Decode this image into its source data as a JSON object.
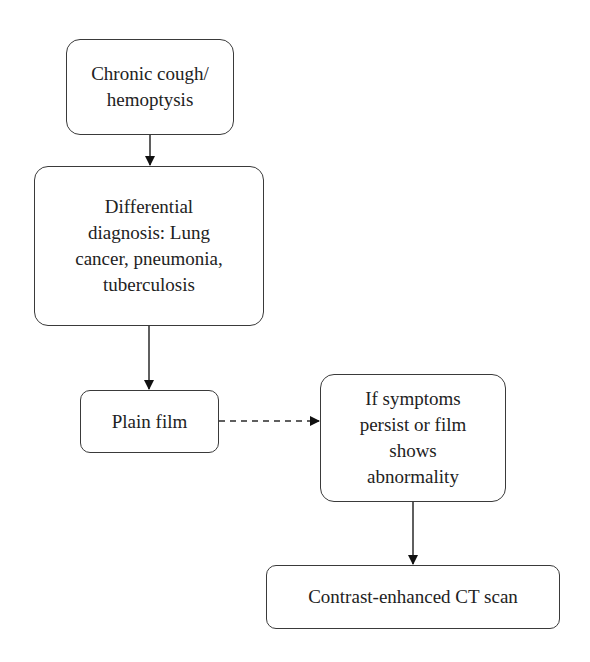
{
  "diagram": {
    "type": "flowchart",
    "colors": {
      "border": "#3a3a3a",
      "text": "#222222",
      "arrow": "#111111",
      "background": "#ffffff"
    },
    "nodes": [
      {
        "id": "n1",
        "label": "Chronic cough/ hemoptysis",
        "lines": [
          "Chronic cough/",
          "hemoptysis"
        ]
      },
      {
        "id": "n2",
        "label": "Differential diagnosis: Lung cancer, pneumonia, tuberculosis",
        "lines": [
          "Differential",
          "diagnosis: Lung",
          "cancer, pneumonia,",
          "tuberculosis"
        ]
      },
      {
        "id": "n3",
        "label": "Plain film",
        "lines": [
          "Plain film"
        ]
      },
      {
        "id": "n4",
        "label": "If symptoms persist or film shows abnormality",
        "lines": [
          "If symptoms",
          "persist or film",
          "shows",
          "abnormality"
        ]
      },
      {
        "id": "n5",
        "label": "Contrast-enhanced CT scan",
        "lines": [
          "Contrast-enhanced CT scan"
        ]
      }
    ],
    "edges": [
      {
        "from": "n1",
        "to": "n2",
        "style": "solid"
      },
      {
        "from": "n2",
        "to": "n3",
        "style": "solid"
      },
      {
        "from": "n3",
        "to": "n4",
        "style": "dashed"
      },
      {
        "from": "n4",
        "to": "n5",
        "style": "solid"
      }
    ]
  }
}
